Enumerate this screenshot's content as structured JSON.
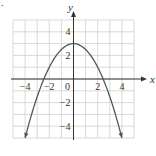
{
  "figure_marker": ".",
  "chart_data": {
    "type": "line",
    "title": "",
    "xlabel": "x",
    "ylabel": "y",
    "xlim": [
      -5,
      5
    ],
    "ylim": [
      -5,
      5
    ],
    "grid": true,
    "grid_step": 1,
    "x_ticks": [
      -4,
      -2,
      0,
      2,
      4
    ],
    "x_tick_labels": [
      "-4",
      "-2",
      "0",
      "2",
      "4"
    ],
    "y_ticks": [
      4,
      2,
      -2,
      -4
    ],
    "y_tick_labels": [
      "4",
      "2",
      "-2",
      "-4"
    ],
    "series": [
      {
        "name": "parabola",
        "equation": "y = 3 - x^2/2",
        "vertex": [
          0,
          3
        ],
        "x_intercepts": [
          -2.45,
          2.45
        ],
        "domain": [
          -4,
          4
        ],
        "arrows_at_ends": true,
        "points": [
          [
            -4,
            -5
          ],
          [
            -3,
            -1.5
          ],
          [
            -2,
            1
          ],
          [
            -1,
            2.5
          ],
          [
            0,
            3
          ],
          [
            1,
            2.5
          ],
          [
            2,
            1
          ],
          [
            3,
            -1.5
          ],
          [
            4,
            -5
          ]
        ],
        "color": "#555555"
      }
    ],
    "colors": {
      "grid": "#cfcfcf",
      "axis": "#333333",
      "curve": "#555555"
    }
  }
}
